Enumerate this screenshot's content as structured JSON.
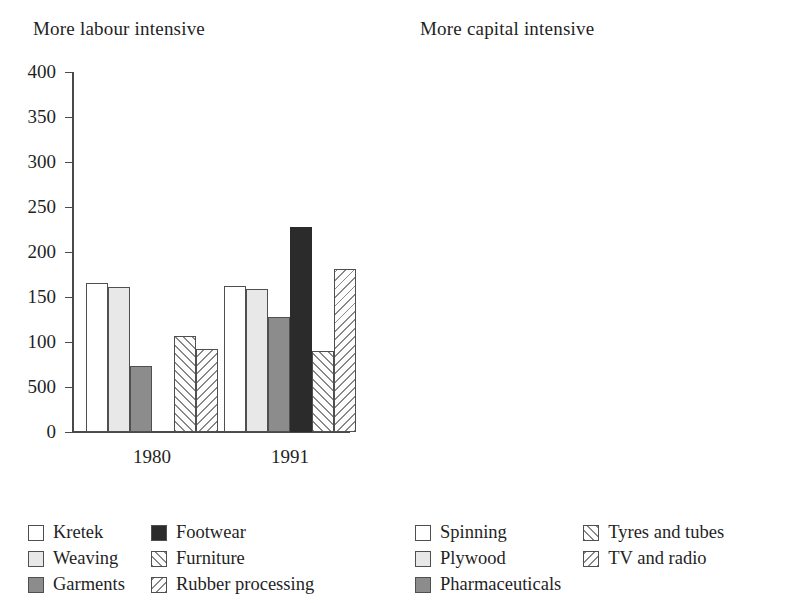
{
  "chart_data": [
    {
      "type": "bar",
      "title": "More labour intensive",
      "xlabel": "",
      "ylabel": "",
      "categories": [
        "1980",
        "1991"
      ],
      "ylim": [
        0,
        400
      ],
      "yticks": [
        0,
        50,
        100,
        150,
        200,
        250,
        300,
        350,
        400
      ],
      "ytick_labels": [
        "0",
        "500",
        "100",
        "150",
        "200",
        "250",
        "300",
        "350",
        "400"
      ],
      "grid": false,
      "legend_position": "bottom-left",
      "series": [
        {
          "name": "Kretek",
          "pattern": "solid-white",
          "values": [
            166,
            162
          ]
        },
        {
          "name": "Weaving",
          "pattern": "solid-light",
          "values": [
            161,
            159
          ]
        },
        {
          "name": "Garments",
          "pattern": "solid-mid",
          "values": [
            73,
            128
          ]
        },
        {
          "name": "Footwear",
          "pattern": "solid-black",
          "values": [
            0,
            228
          ]
        },
        {
          "name": "Furniture",
          "pattern": "hatch-forward",
          "values": [
            107,
            90
          ]
        },
        {
          "name": "Rubber processing",
          "pattern": "hatch-back",
          "values": [
            92,
            181
          ]
        }
      ]
    },
    {
      "type": "bar",
      "title": "More capital intensive",
      "xlabel": "",
      "ylabel": "",
      "categories": [
        "1980",
        "1991"
      ],
      "ylim": [
        0,
        400
      ],
      "yticks": [
        0,
        50,
        100,
        150,
        200,
        250,
        300,
        350,
        400
      ],
      "ytick_labels": [
        "0",
        "500",
        "100",
        "150",
        "200",
        "250",
        "300",
        "350",
        "400"
      ],
      "grid": false,
      "legend_position": "bottom-left",
      "series": [
        {
          "name": "Spinning",
          "pattern": "solid-white",
          "values": [
            156,
            158
          ]
        },
        {
          "name": "Plywood",
          "pattern": "solid-light",
          "values": [
            201,
            288
          ]
        },
        {
          "name": "Pharmaceuticals",
          "pattern": "solid-mid",
          "values": [
            162,
            378
          ]
        },
        {
          "name": "Tyres and tubes",
          "pattern": "hatch-forward",
          "values": [
            165,
            223
          ]
        },
        {
          "name": "TV and radio",
          "pattern": "hatch-back",
          "values": [
            129,
            147
          ]
        }
      ]
    }
  ],
  "left": {
    "title": "More labour intensive",
    "ytick_labels": [
      "400",
      "350",
      "300",
      "250",
      "200",
      "150",
      "100",
      "500",
      "0"
    ],
    "group_labels": [
      "1980",
      "1991"
    ],
    "legend": [
      {
        "label": "Kretek"
      },
      {
        "label": "Weaving"
      },
      {
        "label": "Garments"
      },
      {
        "label": "Footwear"
      },
      {
        "label": "Furniture"
      },
      {
        "label": "Rubber processing"
      }
    ]
  },
  "right": {
    "title": "More capital intensive",
    "ytick_labels": [
      "400",
      "350",
      "300",
      "250",
      "200",
      "150",
      "100",
      "500",
      "0"
    ],
    "group_labels": [
      "1980",
      "1991"
    ],
    "legend": [
      {
        "label": "Spinning"
      },
      {
        "label": "Plywood"
      },
      {
        "label": "Pharmaceuticals"
      },
      {
        "label": "Tyres and tubes"
      },
      {
        "label": "TV and radio"
      }
    ]
  }
}
